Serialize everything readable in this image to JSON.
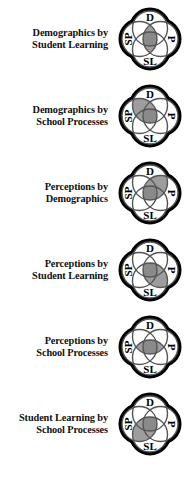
{
  "figure": {
    "background_color": "#ffffff",
    "outline_color": "#000000",
    "circle_line_color": "#555555",
    "shade_color": "#9d9d9d",
    "center_shade_color": "#8a8a8a"
  },
  "venn_letters": {
    "top": "D",
    "right": "P",
    "bottom": "SL",
    "left": "SP"
  },
  "rows": [
    {
      "label_line1": "Demographics by",
      "label_line2": "Student Learning",
      "shaded_region": "horizontal-lens",
      "shaded_pair": [
        "SP",
        "P"
      ]
    },
    {
      "label_line1": "Demographics by",
      "label_line2": "School Processes",
      "shaded_region": "upper-left-lens",
      "shaded_pair": [
        "D",
        "SP"
      ]
    },
    {
      "label_line1": "Perceptions by",
      "label_line2": "Demographics",
      "shaded_region": "upper-right-lens",
      "shaded_pair": [
        "D",
        "P"
      ]
    },
    {
      "label_line1": "Perceptions by",
      "label_line2": "Student Learning",
      "shaded_region": "lower-right-lens",
      "shaded_pair": [
        "P",
        "SL"
      ]
    },
    {
      "label_line1": "Perceptions by",
      "label_line2": "School Processes",
      "shaded_region": "vertical-lens",
      "shaded_pair": [
        "D",
        "SL"
      ]
    },
    {
      "label_line1": "Student Learning by",
      "label_line2": "School Processes",
      "shaded_region": "lower-left-lens",
      "shaded_pair": [
        "SP",
        "SL"
      ]
    }
  ]
}
